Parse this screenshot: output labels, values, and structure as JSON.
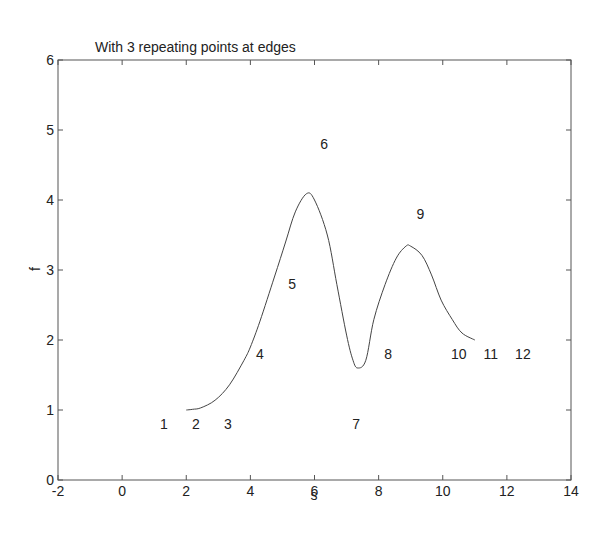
{
  "chart_data": {
    "type": "line",
    "title": "With 3 repeating points at edges",
    "xlabel": "s",
    "ylabel": "f",
    "xlim": [
      -2,
      14
    ],
    "ylim": [
      0,
      6
    ],
    "grid": false,
    "legend": null,
    "xticks": [
      -2,
      0,
      2,
      4,
      6,
      8,
      10,
      12,
      14
    ],
    "yticks": [
      0,
      1,
      2,
      3,
      4,
      5,
      6
    ],
    "series": [
      {
        "name": "spline curve",
        "color": "#444444",
        "x": [
          2.0,
          2.2,
          2.45,
          2.9,
          3.35,
          3.8,
          4.0,
          4.3,
          4.75,
          5.1,
          5.4,
          5.75,
          6.0,
          6.4,
          6.7,
          7.0,
          7.2,
          7.35,
          7.6,
          7.85,
          8.2,
          8.55,
          8.85,
          9.0,
          9.35,
          9.65,
          9.95,
          10.3,
          10.6,
          11.0
        ],
        "y": [
          1.0,
          1.01,
          1.03,
          1.14,
          1.36,
          1.71,
          1.9,
          2.27,
          2.9,
          3.4,
          3.83,
          4.09,
          4.0,
          3.5,
          2.79,
          2.07,
          1.71,
          1.6,
          1.71,
          2.29,
          2.79,
          3.17,
          3.34,
          3.34,
          3.21,
          2.93,
          2.57,
          2.29,
          2.1,
          2.0
        ]
      }
    ],
    "annotations": [
      {
        "text": "1",
        "x": 1.3,
        "y": 0.8
      },
      {
        "text": "2",
        "x": 2.3,
        "y": 0.8
      },
      {
        "text": "3",
        "x": 3.3,
        "y": 0.8
      },
      {
        "text": "4",
        "x": 4.3,
        "y": 1.8
      },
      {
        "text": "5",
        "x": 5.3,
        "y": 2.8
      },
      {
        "text": "6",
        "x": 6.3,
        "y": 4.8
      },
      {
        "text": "7",
        "x": 7.3,
        "y": 0.8
      },
      {
        "text": "8",
        "x": 8.3,
        "y": 1.8
      },
      {
        "text": "9",
        "x": 9.3,
        "y": 3.8
      },
      {
        "text": "10",
        "x": 10.5,
        "y": 1.8
      },
      {
        "text": "11",
        "x": 11.5,
        "y": 1.8
      },
      {
        "text": "12",
        "x": 12.5,
        "y": 1.8
      }
    ]
  },
  "layout": {
    "plot_left": 58,
    "plot_right": 571,
    "plot_top": 60,
    "plot_bottom": 480
  }
}
